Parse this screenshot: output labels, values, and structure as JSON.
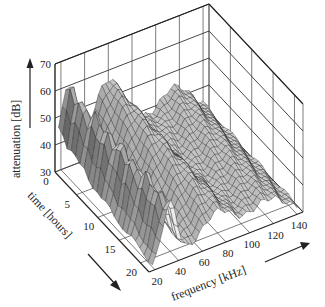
{
  "chart_data": {
    "type": "surface3d",
    "title": "",
    "zlabel": "attenuation [dB]",
    "xlabel": "frequency [kHz]",
    "ylabel": "time [hours]",
    "z_ticks": [
      "30",
      "40",
      "50",
      "60",
      "70"
    ],
    "x_ticks": [
      "20",
      "40",
      "60",
      "80",
      "100",
      "120",
      "140"
    ],
    "y_ticks": [
      "0",
      "5",
      "10",
      "15",
      "20"
    ],
    "zlim": [
      30,
      70
    ],
    "xlim": [
      20,
      140
    ],
    "ylim": [
      0,
      22
    ],
    "grid": true,
    "colormap": "grayscale",
    "approx_ridges": [
      {
        "frequency_khz": 25,
        "peak_db": 63
      },
      {
        "frequency_khz": 60,
        "peak_db": 58
      },
      {
        "frequency_khz": 115,
        "peak_db": 46
      }
    ]
  }
}
